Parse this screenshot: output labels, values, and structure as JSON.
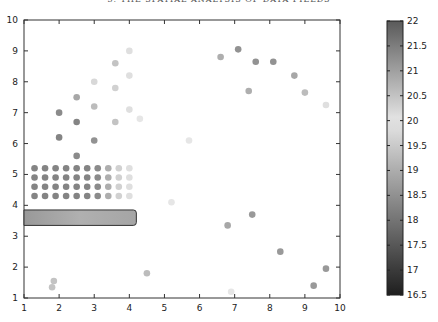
{
  "header": {
    "running_title": "3. THE SPATIAL ANALYSIS OF DATA FIELDS"
  },
  "chart_data": {
    "type": "scatter",
    "title": "",
    "xlabel": "",
    "ylabel": "",
    "xlim": [
      1,
      10
    ],
    "ylim": [
      1,
      10
    ],
    "x_ticks": [
      1,
      2,
      3,
      4,
      5,
      6,
      7,
      8,
      9,
      10
    ],
    "y_ticks": [
      1,
      2,
      3,
      4,
      5,
      6,
      7,
      8,
      9,
      10
    ],
    "grid": false,
    "colorbar": {
      "range": [
        16.5,
        22
      ],
      "ticks": [
        "22",
        "21.5",
        "21",
        "20.5",
        "20",
        "19.5",
        "19",
        "18.5",
        "18",
        "17.5",
        "17",
        "16.5"
      ],
      "position": "right"
    },
    "overlay_rect": {
      "x0": 1.0,
      "x1": 4.2,
      "y0": 3.35,
      "y1": 3.85
    },
    "points": [
      {
        "x": 2.0,
        "y": 7.0,
        "v": 21.3
      },
      {
        "x": 2.0,
        "y": 6.2,
        "v": 21.4
      },
      {
        "x": 2.5,
        "y": 7.5,
        "v": 20.9
      },
      {
        "x": 2.5,
        "y": 6.7,
        "v": 21.4
      },
      {
        "x": 2.5,
        "y": 5.6,
        "v": 21.3
      },
      {
        "x": 3.0,
        "y": 8.0,
        "v": 20.2
      },
      {
        "x": 3.0,
        "y": 7.2,
        "v": 20.6
      },
      {
        "x": 3.0,
        "y": 6.1,
        "v": 21.2
      },
      {
        "x": 3.6,
        "y": 8.6,
        "v": 20.5
      },
      {
        "x": 3.6,
        "y": 7.8,
        "v": 20.3
      },
      {
        "x": 3.6,
        "y": 6.7,
        "v": 20.5
      },
      {
        "x": 4.0,
        "y": 9.0,
        "v": 20.1
      },
      {
        "x": 4.0,
        "y": 8.2,
        "v": 20.1
      },
      {
        "x": 4.0,
        "y": 7.1,
        "v": 20.1
      },
      {
        "x": 4.3,
        "y": 6.8,
        "v": 20.0
      },
      {
        "x": 5.2,
        "y": 4.1,
        "v": 20.0
      },
      {
        "x": 5.7,
        "y": 6.1,
        "v": 20.0
      },
      {
        "x": 6.6,
        "y": 8.8,
        "v": 20.8
      },
      {
        "x": 7.1,
        "y": 9.05,
        "v": 21.2
      },
      {
        "x": 7.6,
        "y": 8.65,
        "v": 21.2
      },
      {
        "x": 8.1,
        "y": 8.65,
        "v": 21.2
      },
      {
        "x": 8.7,
        "y": 8.2,
        "v": 20.9
      },
      {
        "x": 7.4,
        "y": 7.7,
        "v": 20.8
      },
      {
        "x": 9.0,
        "y": 7.65,
        "v": 20.6
      },
      {
        "x": 9.6,
        "y": 7.25,
        "v": 20.1
      },
      {
        "x": 6.8,
        "y": 3.35,
        "v": 20.9
      },
      {
        "x": 7.5,
        "y": 3.7,
        "v": 21.1
      },
      {
        "x": 8.3,
        "y": 2.5,
        "v": 21.1
      },
      {
        "x": 9.6,
        "y": 1.95,
        "v": 21.1
      },
      {
        "x": 9.25,
        "y": 1.4,
        "v": 21.1
      },
      {
        "x": 6.9,
        "y": 1.2,
        "v": 20.0
      },
      {
        "x": 4.5,
        "y": 1.8,
        "v": 20.6
      },
      {
        "x": 1.85,
        "y": 1.55,
        "v": 20.5
      },
      {
        "x": 1.8,
        "y": 1.35,
        "v": 20.5
      }
    ],
    "grid_points": {
      "x": [
        1.3,
        1.6,
        1.9,
        2.2,
        2.5,
        2.8,
        3.1,
        3.4,
        3.7,
        4.0
      ],
      "y": [
        5.2,
        4.9,
        4.6,
        4.3
      ],
      "values_by_column": [
        21.4,
        21.4,
        21.4,
        21.4,
        21.4,
        21.4,
        21.3,
        20.8,
        20.3,
        20.1
      ]
    }
  }
}
